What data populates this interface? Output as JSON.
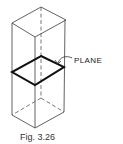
{
  "figure": {
    "plane_label": "PLANE",
    "caption": "Fig. 3.26"
  },
  "colors": {
    "background": "#ffffff",
    "line": "#3a3a3a",
    "plane_outline": "#111111"
  }
}
